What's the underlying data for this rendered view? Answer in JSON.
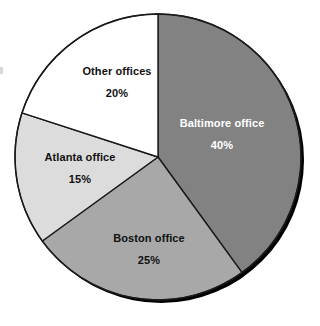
{
  "chart_data": {
    "type": "pie",
    "title": "",
    "subtitle": "",
    "xlabel": "",
    "ylabel": "",
    "legend_position": "none",
    "grid": false,
    "labels_inside_slices": true,
    "start_angle_deg": 0,
    "direction": "clockwise",
    "categories": [
      "Baltimore office",
      "Boston office",
      "Atlanta office",
      "Other offices"
    ],
    "values": [
      40,
      25,
      15,
      20
    ],
    "value_labels": [
      "40%",
      "25%",
      "15%",
      "20%"
    ],
    "unit": "%",
    "total": 100,
    "slices": [
      {
        "label": "Baltimore office",
        "value": 40,
        "value_label": "40%",
        "fill": "#828282",
        "stroke": "#1a1a1a",
        "text_color": "#ffffff"
      },
      {
        "label": "Boston office",
        "value": 25,
        "value_label": "25%",
        "fill": "#a8a8a8",
        "stroke": "#1a1a1a",
        "text_color": "#111111"
      },
      {
        "label": "Atlanta office",
        "value": 15,
        "value_label": "15%",
        "fill": "#dcdcdc",
        "stroke": "#1a1a1a",
        "text_color": "#111111"
      },
      {
        "label": "Other offices",
        "value": 20,
        "value_label": "20%",
        "fill": "#ffffff",
        "stroke": "#1a1a1a",
        "text_color": "#111111"
      }
    ]
  },
  "figure": {
    "background": "#ffffff",
    "shadow_color": "#000000"
  }
}
